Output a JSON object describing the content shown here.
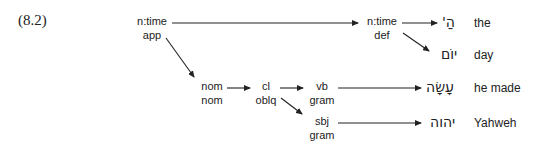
{
  "example_number": "(8.2)",
  "nodes": {
    "root": {
      "top": "n:time",
      "bottom": "app"
    },
    "det_node": {
      "top": "n:time",
      "bottom": "def"
    },
    "nom": {
      "top": "nom",
      "bottom": "nom"
    },
    "cl": {
      "top": "cl",
      "bottom": "oblq"
    },
    "vb": {
      "top": "vb",
      "bottom": "gram"
    },
    "sbj": {
      "top": "sbj",
      "bottom": "gram"
    }
  },
  "leaves": [
    {
      "hebrew": "הַ'",
      "gloss": "the"
    },
    {
      "hebrew": "יוֹם",
      "gloss": "day"
    },
    {
      "hebrew": "עָשָׂה",
      "gloss": "he made"
    },
    {
      "hebrew": "יהוה",
      "gloss": "Yahweh"
    }
  ],
  "colors": {
    "ink": "#222222",
    "background": "#ffffff"
  }
}
